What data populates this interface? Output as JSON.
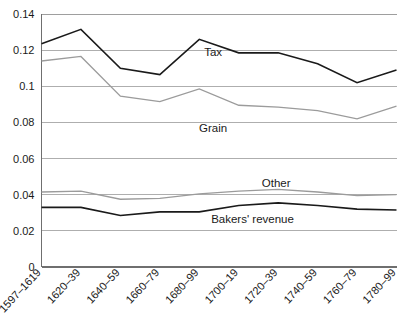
{
  "chart_data": {
    "type": "line",
    "title": "",
    "subtitle": "",
    "xlabel": "",
    "ylabel": "",
    "grid": true,
    "legend_position": "inline-annotations",
    "categories": [
      "1597–1619",
      "1620–39",
      "1640–59",
      "1660–79",
      "1680–99",
      "1700–19",
      "1720–39",
      "1740–59",
      "1760–79",
      "1780–99"
    ],
    "ylim": [
      0,
      0.14
    ],
    "ytick_labels": [
      "0",
      "0.02",
      "0.04",
      "0.06",
      "0.08",
      "0.1",
      "0.12",
      "0.14"
    ],
    "ytick_values": [
      0,
      0.02,
      0.04,
      0.06,
      0.08,
      0.1,
      0.12,
      0.14
    ],
    "series": [
      {
        "name": "Tax",
        "color": "#1a1a1a",
        "width": 1.6,
        "label_x_index": 4.35,
        "label_y": 0.1165,
        "label_anchor": "middle",
        "values": [
          0.1235,
          0.1315,
          0.11,
          0.1065,
          0.126,
          0.1185,
          0.1185,
          0.1125,
          0.102,
          0.109
        ]
      },
      {
        "name": "Grain",
        "color": "#9b9b9b",
        "width": 1.3,
        "label_x_index": 4.35,
        "label_y": 0.0745,
        "label_anchor": "middle",
        "values": [
          0.114,
          0.1165,
          0.0945,
          0.0915,
          0.0985,
          0.0895,
          0.0885,
          0.0865,
          0.082,
          0.089
        ]
      },
      {
        "name": "Other",
        "color": "#9b9b9b",
        "width": 1.3,
        "label_x_index": 5.95,
        "label_y": 0.0445,
        "label_anchor": "middle",
        "values": [
          0.0415,
          0.042,
          0.0375,
          0.038,
          0.0405,
          0.042,
          0.043,
          0.0415,
          0.0395,
          0.04
        ]
      },
      {
        "name": "Bakers' revenue",
        "color": "#1a1a1a",
        "width": 1.6,
        "label_x_index": 5.35,
        "label_y": 0.0245,
        "label_anchor": "middle",
        "values": [
          0.033,
          0.033,
          0.0285,
          0.0305,
          0.0305,
          0.034,
          0.0355,
          0.034,
          0.032,
          0.0315
        ]
      }
    ]
  }
}
